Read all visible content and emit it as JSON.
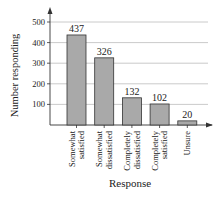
{
  "chart_data": {
    "type": "bar",
    "title": "",
    "xlabel": "Response",
    "ylabel": "Number responding",
    "categories": [
      "Somewhat satisfied",
      "Somewhat dissatisfied",
      "Completely dissatisfied",
      "Completely satisfied",
      "Unsure"
    ],
    "category_lines": [
      [
        "Somewhat",
        "satisfied"
      ],
      [
        "Somewhat",
        "dissatisfied"
      ],
      [
        "Completely",
        "dissatisfied"
      ],
      [
        "Completely",
        "satisfied"
      ],
      [
        "Unsure"
      ]
    ],
    "values": [
      437,
      326,
      132,
      102,
      20
    ],
    "data_labels": [
      "437",
      "326",
      "132",
      "102",
      "20"
    ],
    "yticks": [
      100,
      200,
      300,
      400,
      500
    ],
    "ytick_labels": [
      "100",
      "200",
      "300",
      "400",
      "500"
    ],
    "ylim": [
      0,
      500
    ],
    "grid": true,
    "legend": null
  },
  "colors": {
    "bar_fill": "#a9a9a9",
    "bar_stroke": "#333333",
    "grid": "#bdbdbd",
    "axis": "#333333"
  }
}
